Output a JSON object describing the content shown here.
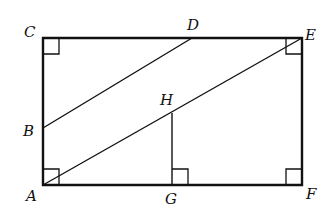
{
  "diagram": {
    "type": "geometry",
    "points": {
      "A": {
        "label": "A",
        "x": 43,
        "y": 185
      },
      "B": {
        "label": "B",
        "x": 43,
        "y": 128
      },
      "C": {
        "label": "C",
        "x": 43,
        "y": 38
      },
      "D": {
        "label": "D",
        "x": 192,
        "y": 38
      },
      "E": {
        "label": "E",
        "x": 302,
        "y": 38
      },
      "F": {
        "label": "F",
        "x": 302,
        "y": 185
      },
      "G": {
        "label": "G",
        "x": 172,
        "y": 185
      },
      "H": {
        "label": "H",
        "x": 172,
        "y": 113
      }
    },
    "segments": [
      "AC",
      "CE",
      "EF",
      "FA",
      "BD",
      "AE",
      "HG"
    ],
    "right_angles": [
      "C",
      "E",
      "A",
      "F",
      "G"
    ],
    "labels": {
      "A": "A",
      "B": "B",
      "C": "C",
      "D": "D",
      "E": "E",
      "F": "F",
      "G": "G",
      "H": "H"
    }
  }
}
